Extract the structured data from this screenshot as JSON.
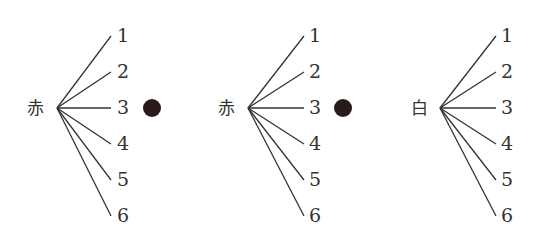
{
  "diagram": {
    "type": "tree",
    "trees": [
      {
        "root": "赤",
        "leaves": [
          "1",
          "2",
          "3",
          "4",
          "5",
          "6"
        ],
        "marked_leaf_index": 2,
        "marker": "filled-circle"
      },
      {
        "root": "赤",
        "leaves": [
          "1",
          "2",
          "3",
          "4",
          "5",
          "6"
        ],
        "marked_leaf_index": 2,
        "marker": "filled-circle"
      },
      {
        "root": "白",
        "leaves": [
          "1",
          "2",
          "3",
          "4",
          "5",
          "6"
        ],
        "marked_leaf_index": null
      }
    ],
    "colors": {
      "line": "#333333",
      "marker": "#2a1a1a"
    }
  }
}
